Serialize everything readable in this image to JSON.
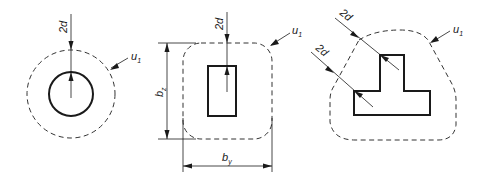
{
  "figure": {
    "colors": {
      "line": "#1a1a1a",
      "background": "#ffffff"
    },
    "panels": [
      {
        "name": "circular",
        "labels": {
          "offset": "2d",
          "perimeter": "u",
          "perimeter_sub": "1"
        }
      },
      {
        "name": "rectangular",
        "labels": {
          "offset": "2d",
          "perimeter": "u",
          "perimeter_sub": "1",
          "dim_z": "b",
          "dim_z_sub": "z",
          "dim_y": "b",
          "dim_y_sub": "y"
        }
      },
      {
        "name": "t-shaped",
        "labels": {
          "offset_1": "2d",
          "offset_2": "2d",
          "perimeter": "u",
          "perimeter_sub": "1"
        }
      }
    ]
  }
}
